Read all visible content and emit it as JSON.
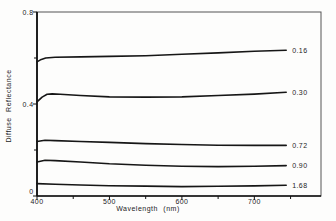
{
  "figure": {
    "background": "#fdfdfc",
    "frame_color": "#555555",
    "axis_color": "#111111"
  },
  "chart_data": {
    "type": "line",
    "title": "",
    "xlabel": "Wavelength (nm)",
    "ylabel": "Diffuse  Reflectance",
    "xlim": [
      400,
      792
    ],
    "ylim": [
      0,
      0.8
    ],
    "grid": false,
    "legend_position": "right-end-labels",
    "line_color": "#161616",
    "xticks": {
      "major": [
        {
          "v": 400,
          "label": "400"
        },
        {
          "v": 500,
          "label": "500"
        },
        {
          "v": 600,
          "label": "600"
        },
        {
          "v": 700,
          "label": "700"
        }
      ],
      "minor": [
        450,
        550,
        650,
        750
      ]
    },
    "yticks": {
      "major": [
        {
          "v": 0,
          "label": "0"
        },
        {
          "v": 0.4,
          "label": "0.4"
        },
        {
          "v": 0.8,
          "label": "0.8"
        }
      ],
      "minor": [
        0.2,
        0.6
      ]
    },
    "series": [
      {
        "name": "0.16",
        "points": [
          [
            400,
            0.583
          ],
          [
            406,
            0.594
          ],
          [
            412,
            0.6
          ],
          [
            425,
            0.603
          ],
          [
            460,
            0.605
          ],
          [
            500,
            0.607
          ],
          [
            550,
            0.61
          ],
          [
            600,
            0.616
          ],
          [
            650,
            0.622
          ],
          [
            700,
            0.629
          ],
          [
            744,
            0.634
          ]
        ]
      },
      {
        "name": "0.30",
        "points": [
          [
            400,
            0.409
          ],
          [
            407,
            0.43
          ],
          [
            414,
            0.442
          ],
          [
            421,
            0.444
          ],
          [
            432,
            0.442
          ],
          [
            460,
            0.437
          ],
          [
            500,
            0.431
          ],
          [
            550,
            0.43
          ],
          [
            600,
            0.431
          ],
          [
            650,
            0.437
          ],
          [
            700,
            0.443
          ],
          [
            744,
            0.451
          ]
        ]
      },
      {
        "name": "0.72",
        "points": [
          [
            400,
            0.237
          ],
          [
            411,
            0.242
          ],
          [
            425,
            0.241
          ],
          [
            460,
            0.237
          ],
          [
            500,
            0.233
          ],
          [
            550,
            0.228
          ],
          [
            600,
            0.224
          ],
          [
            650,
            0.221
          ],
          [
            700,
            0.22
          ],
          [
            744,
            0.22
          ]
        ]
      },
      {
        "name": "0.90",
        "points": [
          [
            400,
            0.148
          ],
          [
            411,
            0.155
          ],
          [
            425,
            0.154
          ],
          [
            460,
            0.148
          ],
          [
            500,
            0.14
          ],
          [
            550,
            0.134
          ],
          [
            600,
            0.129
          ],
          [
            650,
            0.128
          ],
          [
            700,
            0.129
          ],
          [
            744,
            0.132
          ]
        ]
      },
      {
        "name": "1.68",
        "points": [
          [
            400,
            0.054
          ],
          [
            425,
            0.051
          ],
          [
            460,
            0.048
          ],
          [
            500,
            0.045
          ],
          [
            550,
            0.043
          ],
          [
            600,
            0.041
          ],
          [
            650,
            0.042
          ],
          [
            700,
            0.044
          ],
          [
            744,
            0.047
          ]
        ]
      }
    ]
  }
}
